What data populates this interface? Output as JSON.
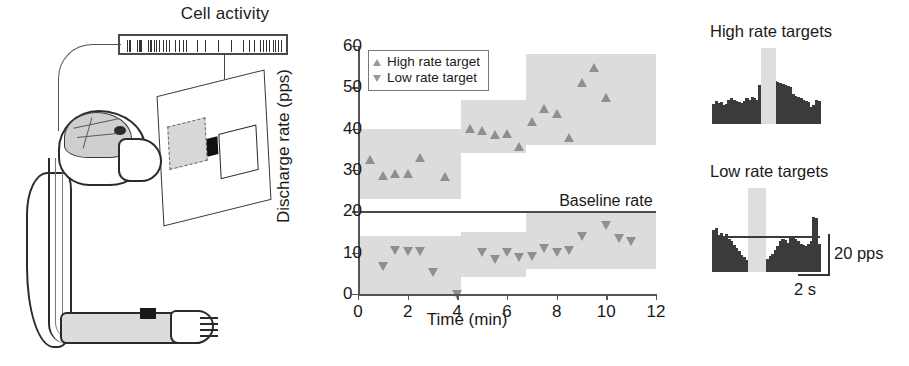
{
  "left_panel": {
    "title": "Cell activity",
    "spike_positions": [
      4,
      6,
      7,
      14,
      16,
      17,
      18,
      25,
      27,
      28,
      31,
      33,
      36,
      40,
      43,
      46,
      52,
      56,
      60,
      63,
      74,
      82,
      95,
      108,
      120,
      126,
      131,
      137,
      140,
      143,
      146,
      150,
      152,
      155,
      158
    ]
  },
  "chart_data": {
    "type": "scatter",
    "title": "",
    "xlabel": "Time (min)",
    "ylabel": "Discharge rate (pps)",
    "xlim": [
      0,
      12
    ],
    "ylim": [
      0,
      60
    ],
    "xticks": [
      0,
      2,
      4,
      6,
      8,
      10,
      12
    ],
    "yticks": [
      0,
      10,
      20,
      30,
      40,
      50,
      60
    ],
    "grid": false,
    "legend_position": "top-left",
    "legend": [
      "High rate target",
      "Low rate target"
    ],
    "baseline": {
      "value": 20,
      "label": "Baseline rate"
    },
    "series": [
      {
        "name": "High rate target",
        "marker": "triangle-up",
        "points": [
          {
            "x": 0.5,
            "y": 32.5
          },
          {
            "x": 1.0,
            "y": 28.5
          },
          {
            "x": 1.5,
            "y": 29.0
          },
          {
            "x": 2.0,
            "y": 29.0
          },
          {
            "x": 2.5,
            "y": 32.8
          },
          {
            "x": 3.5,
            "y": 28.3
          },
          {
            "x": 4.5,
            "y": 40.0
          },
          {
            "x": 5.0,
            "y": 39.5
          },
          {
            "x": 5.5,
            "y": 38.5
          },
          {
            "x": 6.0,
            "y": 38.7
          },
          {
            "x": 6.5,
            "y": 35.6
          },
          {
            "x": 7.0,
            "y": 41.5
          },
          {
            "x": 7.5,
            "y": 44.8
          },
          {
            "x": 8.0,
            "y": 43.6
          },
          {
            "x": 8.5,
            "y": 37.8
          },
          {
            "x": 9.0,
            "y": 51.0
          },
          {
            "x": 9.5,
            "y": 54.6
          },
          {
            "x": 10.0,
            "y": 47.3
          }
        ]
      },
      {
        "name": "Low rate target",
        "marker": "triangle-down",
        "points": [
          {
            "x": 1.0,
            "y": 6.5
          },
          {
            "x": 1.5,
            "y": 10.4
          },
          {
            "x": 2.0,
            "y": 10.2
          },
          {
            "x": 2.5,
            "y": 10.2
          },
          {
            "x": 3.0,
            "y": 5.2
          },
          {
            "x": 4.0,
            "y": -0.3
          },
          {
            "x": 5.0,
            "y": 10.0
          },
          {
            "x": 5.5,
            "y": 8.2
          },
          {
            "x": 6.0,
            "y": 10.0
          },
          {
            "x": 6.5,
            "y": 8.8
          },
          {
            "x": 7.0,
            "y": 8.9
          },
          {
            "x": 7.5,
            "y": 10.9
          },
          {
            "x": 8.0,
            "y": 9.8
          },
          {
            "x": 8.5,
            "y": 10.3
          },
          {
            "x": 9.0,
            "y": 13.8
          },
          {
            "x": 10.0,
            "y": 16.4
          },
          {
            "x": 10.5,
            "y": 13.2
          },
          {
            "x": 11.0,
            "y": 12.7
          }
        ]
      }
    ],
    "bands": [
      {
        "series": "High rate target",
        "x0": 0.0,
        "x1": 4.15,
        "y0": 23,
        "y1": 40
      },
      {
        "series": "High rate target",
        "x0": 4.15,
        "x1": 6.75,
        "y0": 34,
        "y1": 47
      },
      {
        "series": "High rate target",
        "x0": 6.75,
        "x1": 12.0,
        "y0": 36,
        "y1": 58
      },
      {
        "series": "Low rate target",
        "x0": 0.0,
        "x1": 4.15,
        "y0": 0,
        "y1": 14
      },
      {
        "series": "Low rate target",
        "x0": 4.15,
        "x1": 6.75,
        "y0": 4,
        "y1": 15
      },
      {
        "series": "Low rate target",
        "x0": 6.75,
        "x1": 12.0,
        "y0": 6,
        "y1": 20
      }
    ]
  },
  "right_panel": {
    "high": {
      "title": "High rate targets",
      "bars": [
        36,
        42,
        38,
        40,
        34,
        36,
        44,
        46,
        44,
        42,
        40,
        38,
        42,
        46,
        44,
        48,
        46,
        44,
        70,
        60,
        80,
        84,
        82,
        80,
        78,
        76,
        74,
        72,
        70,
        68,
        66,
        54,
        50,
        48,
        46,
        44,
        42,
        40,
        30,
        34,
        44,
        42
      ],
      "cue_start_index": 19,
      "cue_end_index": 24
    },
    "low": {
      "title": "Low rate targets",
      "bars": [
        68,
        72,
        60,
        64,
        58,
        62,
        54,
        50,
        44,
        40,
        34,
        28,
        24,
        20,
        18,
        16,
        14,
        18,
        16,
        20,
        18,
        22,
        26,
        30,
        36,
        42,
        50,
        54,
        52,
        48,
        56,
        58,
        54,
        50,
        46,
        44,
        42,
        46,
        50,
        90,
        88,
        46
      ],
      "cue_start_index": 14,
      "cue_end_index": 20,
      "baseline_level": 56
    },
    "scale_vertical_label": "20 pps",
    "scale_horizontal_label": "2 s"
  }
}
